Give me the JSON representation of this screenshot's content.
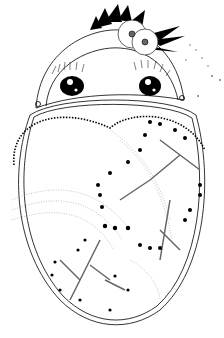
{
  "illustration": {
    "title": "",
    "style": "black-and-white line art coloring page",
    "subject": "kokeshi doll with flower hair ornament and heart-shaped body with dandelion-like branches",
    "colors": {
      "ink": "#000000",
      "paper": "#ffffff",
      "gray": "#888888"
    },
    "parts": [
      "hair-ornament",
      "flowers",
      "head",
      "eyes",
      "eyelashes",
      "heart-pattern",
      "dotted-arcs",
      "branch-clusters",
      "body-outline",
      "sparkle-trail"
    ]
  }
}
